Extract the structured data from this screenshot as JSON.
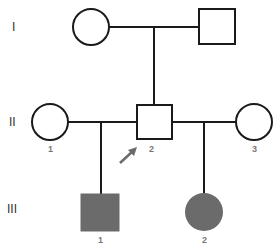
{
  "diagram": {
    "type": "pedigree",
    "colors": {
      "line": "#1a1a1a",
      "affected_fill": "#6b6b6b",
      "unaffected_fill": "#ffffff",
      "arrow": "#6b6b6b",
      "label": "#777777"
    },
    "generations": [
      {
        "label": "I"
      },
      {
        "label": "II"
      },
      {
        "label": "III"
      }
    ],
    "individuals": [
      {
        "id": "I-female",
        "generation": "I",
        "number": "",
        "sex": "female",
        "affected": false
      },
      {
        "id": "I-male",
        "generation": "I",
        "number": "",
        "sex": "male",
        "affected": false
      },
      {
        "id": "II-1",
        "generation": "II",
        "number": "1",
        "sex": "female",
        "affected": false
      },
      {
        "id": "II-2",
        "generation": "II",
        "number": "2",
        "sex": "male",
        "affected": false,
        "proband": true
      },
      {
        "id": "II-3",
        "generation": "II",
        "number": "3",
        "sex": "female",
        "affected": false
      },
      {
        "id": "III-1",
        "generation": "III",
        "number": "1",
        "sex": "male",
        "affected": true
      },
      {
        "id": "III-2",
        "generation": "III",
        "number": "2",
        "sex": "female",
        "affected": true
      }
    ],
    "matings": [
      {
        "partners": [
          "I-female",
          "I-male"
        ],
        "children": [
          "II-2"
        ]
      },
      {
        "partners": [
          "II-1",
          "II-2"
        ],
        "children": [
          "III-1"
        ]
      },
      {
        "partners": [
          "II-2",
          "II-3"
        ],
        "children": [
          "III-2"
        ]
      }
    ],
    "proband_marker": "arrow"
  }
}
